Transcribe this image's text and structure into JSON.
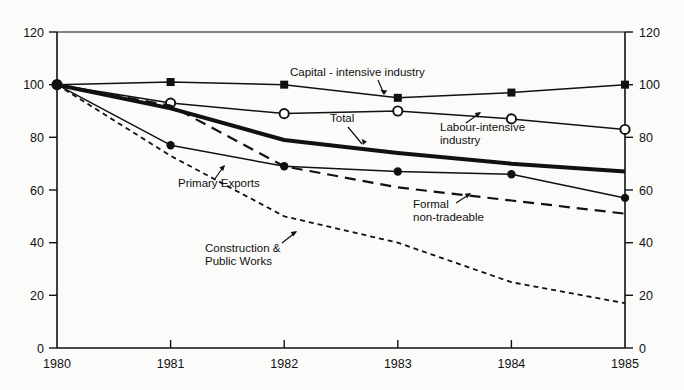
{
  "chart_data": {
    "type": "line",
    "title": "",
    "subtitle": "",
    "xlabel": "",
    "ylabel": "",
    "x": [
      1980,
      1981,
      1982,
      1983,
      1984,
      1985
    ],
    "xtick_labels": [
      "1980",
      "1981",
      "1982",
      "1983",
      "1984",
      "1985"
    ],
    "ytick_labels": [
      "0",
      "20",
      "40",
      "60",
      "80",
      "100",
      "120"
    ],
    "yticks": [
      0,
      20,
      40,
      60,
      80,
      100,
      120
    ],
    "ylim": [
      0,
      120
    ],
    "xlim": [
      1980,
      1985
    ],
    "grid": false,
    "legend": "none (direct line annotations)",
    "dual_axis": true,
    "right_axis_labels": [
      "0",
      "20",
      "40",
      "60",
      "80",
      "100",
      "120"
    ],
    "series": [
      {
        "name": "Capital - intensive industry",
        "marker": "filled-square",
        "style": "solid-thin",
        "values": [
          100,
          101,
          100,
          95,
          97,
          100
        ]
      },
      {
        "name": "Labour-intensive industry",
        "marker": "open-circle",
        "style": "solid-thin",
        "values": [
          100,
          93,
          89,
          90,
          87,
          83
        ]
      },
      {
        "name": "Total",
        "marker": "none",
        "style": "solid-thick",
        "values": [
          100,
          91,
          79,
          74,
          70,
          67
        ]
      },
      {
        "name": "Primary Exports",
        "marker": "filled-circle",
        "style": "solid-thin",
        "values": [
          100,
          77,
          69,
          67,
          66,
          57
        ]
      },
      {
        "name": "Formal non-tradeable",
        "marker": "none",
        "style": "dashed",
        "values": [
          100,
          92,
          69,
          61,
          56,
          51
        ]
      },
      {
        "name": "Construction & Public Works",
        "marker": "none",
        "style": "dotted",
        "values": [
          100,
          73,
          50,
          40,
          25,
          17
        ]
      }
    ],
    "annotations": [
      {
        "text_line1": "Capital - intensive industry",
        "text_line2": ""
      },
      {
        "text_line1": "Labour-intensive",
        "text_line2": "industry"
      },
      {
        "text_line1": "Total",
        "text_line2": ""
      },
      {
        "text_line1": "Primary Exports",
        "text_line2": ""
      },
      {
        "text_line1": "Formal",
        "text_line2": "non-tradeable"
      },
      {
        "text_line1": "Construction &",
        "text_line2": "Public Works"
      }
    ]
  },
  "labels": {
    "y_120": "120",
    "y_100": "100",
    "y_80": "80",
    "y_60": "60",
    "y_40": "40",
    "y_20": "20",
    "y_0": "0",
    "r_120": "120",
    "r_100": "100",
    "r_80": "80",
    "r_60": "60",
    "r_40": "40",
    "r_20": "20",
    "r_0": "0",
    "x_1980": "1980",
    "x_1981": "1981",
    "x_1982": "1982",
    "x_1983": "1983",
    "x_1984": "1984",
    "x_1985": "1985",
    "a_capital": "Capital - intensive industry",
    "a_labour1": "Labour-intensive",
    "a_labour2": "industry",
    "a_total": "Total",
    "a_primary": "Primary Exports",
    "a_formal1": "Formal",
    "a_formal2": "non-tradeable",
    "a_constr1": "Construction &",
    "a_constr2": "Public Works"
  },
  "colors": {
    "ink": "#111111",
    "page": "#fbfbfa"
  }
}
